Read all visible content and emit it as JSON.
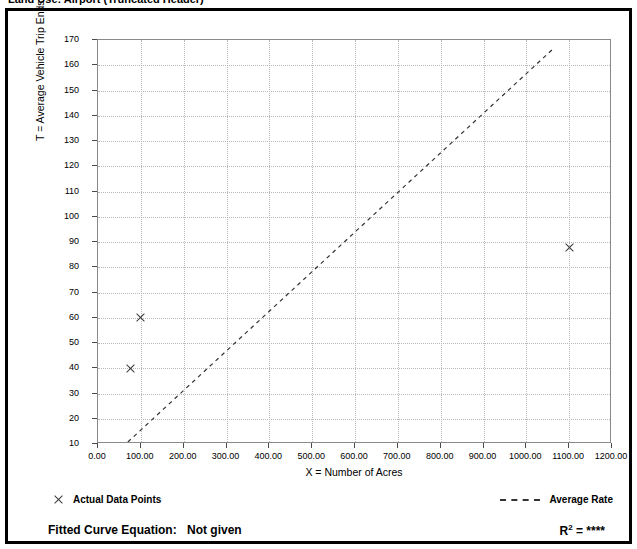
{
  "figure": {
    "title_partial": "Land Use: Airport (Truncated Header)"
  },
  "legend": {
    "data_points_label": "Actual Data Points",
    "average_rate_label": "Average Rate",
    "data_point_marker": "x-marker-icon",
    "average_rate_marker": "dashed-line-icon"
  },
  "footer": {
    "equation_label": "Fitted Curve Equation:",
    "equation_value": "Not given",
    "r_label": "R",
    "r_exponent": "2",
    "r_equals": " = ",
    "r_value": "****"
  },
  "chart_data": {
    "type": "scatter",
    "title": "",
    "xlabel": "X = Number of Acres",
    "ylabel": "T = Average Vehicle Trip Ends",
    "xlim": [
      0,
      1200
    ],
    "ylim": [
      10,
      170
    ],
    "xticks": [
      0,
      100,
      200,
      300,
      400,
      500,
      600,
      700,
      800,
      900,
      1000,
      1100,
      1200
    ],
    "xtick_labels": [
      "0.00",
      "100.00",
      "200.00",
      "300.00",
      "400.00",
      "500.00",
      "600.00",
      "700.00",
      "800.00",
      "900.00",
      "1000.00",
      "1100.00",
      "1200.00"
    ],
    "yticks": [
      10,
      20,
      30,
      40,
      50,
      60,
      70,
      80,
      90,
      100,
      110,
      120,
      130,
      140,
      150,
      160,
      170
    ],
    "ytick_labels": [
      "10",
      "20",
      "30",
      "40",
      "50",
      "60",
      "70",
      "80",
      "90",
      "100",
      "110",
      "120",
      "130",
      "140",
      "150",
      "160",
      "170"
    ],
    "grid": true,
    "legend_position": "below-plot",
    "series": [
      {
        "name": "Actual Data Points",
        "type": "scatter",
        "marker": "x",
        "points": [
          {
            "x": 75,
            "y": 40
          },
          {
            "x": 100,
            "y": 60
          },
          {
            "x": 1100,
            "y": 88
          }
        ]
      },
      {
        "name": "Average Rate",
        "type": "line",
        "style": "dashed",
        "points": [
          {
            "x": 70,
            "y": 10
          },
          {
            "x": 1070,
            "y": 167
          }
        ]
      }
    ]
  }
}
